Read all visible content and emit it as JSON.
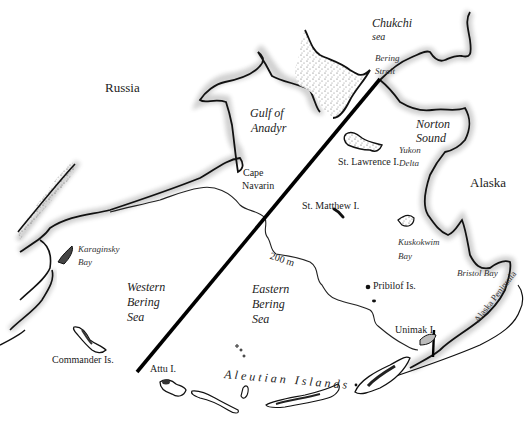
{
  "map": {
    "title": "Bering Sea region",
    "colors": {
      "land_stipple": "#555555",
      "coast": "#111111",
      "sea": "#ffffff",
      "divider": "#000000",
      "isobath": "#222222"
    },
    "labels": {
      "russia": "Russia",
      "alaska": "Alaska",
      "chukchi_1": "Chukchi",
      "chukchi_2": "sea",
      "bering_strait_1": "Bering",
      "bering_strait_2": "Strait",
      "gulf_anadyr_1": "Gulf of",
      "gulf_anadyr_2": "Anadyr",
      "norton_1": "Norton",
      "norton_2": "Sound",
      "yukon_1": "Yukon",
      "yukon_2": "Delta",
      "st_lawrence": "St. Lawrence I.",
      "cape_navarin_1": "Cape",
      "cape_navarin_2": "Navarin",
      "st_matthew": "St. Matthew I.",
      "karaginsky_1": "Karaginsky",
      "karaginsky_2": "Bay",
      "western_1": "Western",
      "western_2": "Bering",
      "western_3": "Sea",
      "eastern_1": "Eastern",
      "eastern_2": "Bering",
      "eastern_3": "Sea",
      "isobath": "200 m",
      "kuskokwim_1": "Kuskokwim",
      "kuskokwim_2": "Bay",
      "pribilof": "Pribilof Is.",
      "bristol": "Bristol Bay",
      "alaska_peninsula": "Alaska Peninsula",
      "unimak": "Unimak I.",
      "commander": "Commander Is.",
      "attu": "Attu I.",
      "aleutian": "Aleutian Islands"
    }
  }
}
